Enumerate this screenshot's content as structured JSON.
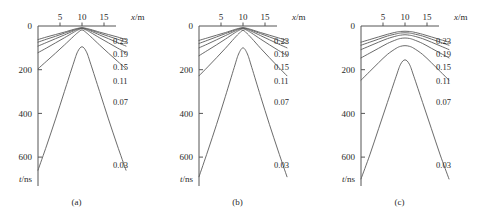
{
  "figure": {
    "panels": [
      {
        "caption": "(a)",
        "x_axis": {
          "label": "x/m",
          "label_italic": "x",
          "label_unit": "/m",
          "ticks": [
            "5",
            "10",
            "15"
          ],
          "tick_values": [
            5,
            10,
            15
          ],
          "position": "top",
          "range": [
            0,
            20
          ]
        },
        "y_axis": {
          "label": "t/ns",
          "label_italic": "t",
          "label_unit": "/ns",
          "ticks": [
            "0",
            "200",
            "400",
            "600"
          ],
          "tick_values": [
            0,
            200,
            400,
            600
          ],
          "position": "left",
          "direction": "downward-increasing",
          "range": [
            0,
            700
          ]
        },
        "curve_labels": [
          "0.23",
          "0.19",
          "0.15",
          "0.11",
          "0.07",
          "0.03"
        ]
      },
      {
        "caption": "(b)",
        "x_axis": {
          "label": "x/m",
          "label_italic": "x",
          "label_unit": "/m",
          "ticks": [
            "5",
            "10",
            "15"
          ],
          "tick_values": [
            5,
            10,
            15
          ],
          "position": "top",
          "range": [
            0,
            20
          ]
        },
        "y_axis": {
          "label": "t/ns",
          "label_italic": "t",
          "label_unit": "/ns",
          "ticks": [
            "0",
            "200",
            "400",
            "600"
          ],
          "tick_values": [
            0,
            200,
            400,
            600
          ],
          "position": "left",
          "direction": "downward-increasing",
          "range": [
            0,
            700
          ]
        },
        "curve_labels": [
          "0.23",
          "0.19",
          "0.15",
          "0.11",
          "0.07",
          "0.03"
        ]
      },
      {
        "caption": "(c)",
        "x_axis": {
          "label": "x/m",
          "label_italic": "x",
          "label_unit": "/m",
          "ticks": [
            "5",
            "10",
            "15"
          ],
          "tick_values": [
            5,
            10,
            15
          ],
          "position": "top",
          "range": [
            0,
            20
          ]
        },
        "y_axis": {
          "label": "t/ns",
          "label_italic": "t",
          "label_unit": "/ns",
          "ticks": [
            "0",
            "200",
            "400",
            "600"
          ],
          "tick_values": [
            0,
            200,
            400,
            600
          ],
          "position": "left",
          "direction": "downward-increasing",
          "range": [
            0,
            700
          ]
        },
        "curve_labels": [
          "0.23",
          "0.19",
          "0.15",
          "0.11",
          "0.07",
          "0.03"
        ]
      }
    ]
  },
  "chart_data": [
    {
      "type": "line",
      "title": "(a)",
      "xlabel": "x/m",
      "ylabel": "t/ns",
      "xlim": [
        0,
        20
      ],
      "ylim": [
        0,
        700
      ],
      "y_inverted": true,
      "grid": false,
      "legend": "inline-right-labels",
      "line_color": "#5a5a5a",
      "series": [
        {
          "name": "0.23",
          "x": [
            0,
            2,
            4,
            6,
            8,
            9,
            10,
            11,
            12,
            14,
            16,
            18,
            20
          ],
          "y": [
            62,
            50,
            39,
            28,
            16,
            11,
            8,
            11,
            16,
            28,
            39,
            50,
            62
          ]
        },
        {
          "name": "0.19",
          "x": [
            0,
            2,
            4,
            6,
            8,
            9,
            10,
            11,
            12,
            14,
            16,
            18,
            20
          ],
          "y": [
            74,
            60,
            47,
            33,
            19,
            13,
            9,
            13,
            19,
            33,
            47,
            60,
            74
          ]
        },
        {
          "name": "0.15",
          "x": [
            0,
            2,
            4,
            6,
            8,
            9,
            10,
            11,
            12,
            14,
            16,
            18,
            20
          ],
          "y": [
            92,
            75,
            58,
            41,
            23,
            15,
            10,
            15,
            23,
            41,
            58,
            75,
            92
          ]
        },
        {
          "name": "0.11",
          "x": [
            0,
            2,
            4,
            6,
            8,
            9,
            10,
            11,
            12,
            14,
            16,
            18,
            20
          ],
          "y": [
            122,
            100,
            77,
            54,
            30,
            19,
            12,
            19,
            30,
            54,
            77,
            100,
            122
          ]
        },
        {
          "name": "0.07",
          "x": [
            0,
            2,
            4,
            6,
            8,
            9,
            10,
            11,
            12,
            14,
            16,
            18,
            20
          ],
          "y": [
            196,
            160,
            124,
            87,
            49,
            31,
            18,
            31,
            49,
            87,
            124,
            160,
            196
          ]
        },
        {
          "name": "0.03",
          "x": [
            0,
            2,
            4,
            6,
            8,
            9,
            10,
            11,
            12,
            14,
            16,
            18,
            20
          ],
          "y": [
            660,
            545,
            425,
            300,
            175,
            118,
            95,
            118,
            175,
            300,
            425,
            545,
            660
          ]
        }
      ]
    },
    {
      "type": "line",
      "title": "(b)",
      "xlabel": "x/m",
      "ylabel": "t/ns",
      "xlim": [
        0,
        20
      ],
      "ylim": [
        0,
        700
      ],
      "y_inverted": true,
      "grid": false,
      "legend": "inline-right-labels",
      "line_color": "#5a5a5a",
      "series": [
        {
          "name": "0.23",
          "x": [
            0,
            2,
            4,
            6,
            8,
            9,
            10,
            11,
            12,
            14,
            16,
            18,
            20
          ],
          "y": [
            66,
            54,
            42,
            30,
            17,
            11,
            8,
            11,
            17,
            30,
            42,
            54,
            66
          ]
        },
        {
          "name": "0.19",
          "x": [
            0,
            2,
            4,
            6,
            8,
            9,
            10,
            11,
            12,
            14,
            16,
            18,
            20
          ],
          "y": [
            80,
            65,
            50,
            35,
            20,
            13,
            9,
            13,
            20,
            35,
            50,
            65,
            80
          ]
        },
        {
          "name": "0.15",
          "x": [
            0,
            2,
            4,
            6,
            8,
            9,
            10,
            11,
            12,
            14,
            16,
            18,
            20
          ],
          "y": [
            100,
            82,
            63,
            44,
            25,
            16,
            10,
            16,
            25,
            44,
            63,
            82,
            100
          ]
        },
        {
          "name": "0.11",
          "x": [
            0,
            2,
            4,
            6,
            8,
            9,
            10,
            11,
            12,
            14,
            16,
            18,
            20
          ],
          "y": [
            136,
            111,
            86,
            60,
            33,
            21,
            13,
            21,
            33,
            60,
            86,
            111,
            136
          ]
        },
        {
          "name": "0.07",
          "x": [
            0,
            2,
            4,
            6,
            8,
            9,
            10,
            11,
            12,
            14,
            16,
            18,
            20
          ],
          "y": [
            228,
            187,
            145,
            102,
            57,
            36,
            20,
            36,
            57,
            102,
            145,
            187,
            228
          ]
        },
        {
          "name": "0.03",
          "x": [
            0,
            2,
            4,
            6,
            8,
            9,
            10,
            11,
            12,
            14,
            16,
            18,
            20
          ],
          "y": [
            690,
            572,
            450,
            322,
            190,
            128,
            100,
            128,
            190,
            322,
            450,
            572,
            690
          ]
        }
      ]
    },
    {
      "type": "line",
      "title": "(c)",
      "xlabel": "x/m",
      "ylabel": "t/ns",
      "xlim": [
        0,
        20
      ],
      "ylim": [
        0,
        700
      ],
      "y_inverted": true,
      "grid": false,
      "legend": "inline-right-labels",
      "line_color": "#5a5a5a",
      "series": [
        {
          "name": "0.23",
          "x": [
            0,
            2,
            4,
            6,
            8,
            9,
            10,
            11,
            12,
            14,
            16,
            18,
            20
          ],
          "y": [
            74,
            62,
            50,
            38,
            28,
            25,
            24,
            25,
            28,
            38,
            50,
            62,
            74
          ]
        },
        {
          "name": "0.19",
          "x": [
            0,
            2,
            4,
            6,
            8,
            9,
            10,
            11,
            12,
            14,
            16,
            18,
            20
          ],
          "y": [
            88,
            74,
            60,
            46,
            36,
            32,
            31,
            32,
            36,
            46,
            60,
            74,
            88
          ]
        },
        {
          "name": "0.15",
          "x": [
            0,
            2,
            4,
            6,
            8,
            9,
            10,
            11,
            12,
            14,
            16,
            18,
            20
          ],
          "y": [
            108,
            91,
            74,
            58,
            46,
            42,
            40,
            42,
            46,
            58,
            74,
            91,
            108
          ]
        },
        {
          "name": "0.11",
          "x": [
            0,
            2,
            4,
            6,
            8,
            9,
            10,
            11,
            12,
            14,
            16,
            18,
            20
          ],
          "y": [
            146,
            124,
            102,
            80,
            63,
            57,
            55,
            57,
            63,
            80,
            102,
            124,
            146
          ]
        },
        {
          "name": "0.07",
          "x": [
            0,
            2,
            4,
            6,
            8,
            9,
            10,
            11,
            12,
            14,
            16,
            18,
            20
          ],
          "y": [
            248,
            208,
            168,
            130,
            102,
            93,
            90,
            93,
            102,
            130,
            168,
            208,
            248
          ]
        },
        {
          "name": "0.03",
          "x": [
            0,
            2,
            4,
            6,
            8,
            9,
            10,
            11,
            12,
            14,
            16,
            18,
            20
          ],
          "y": [
            700,
            590,
            470,
            350,
            230,
            175,
            155,
            175,
            230,
            350,
            470,
            590,
            700
          ]
        }
      ]
    }
  ]
}
